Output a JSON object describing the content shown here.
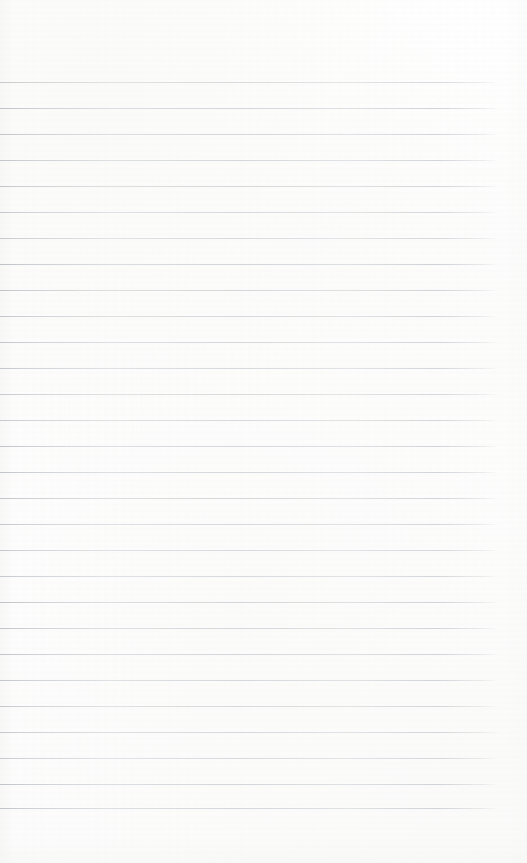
{
  "document": {
    "type": "scanned-lined-notebook-page",
    "title": "Blank lined notebook page",
    "orientation": "portrait",
    "width_px": 527,
    "height_px": 863,
    "background_color": "#fefefe",
    "content_text": "",
    "has_handwriting": false,
    "has_printed_text": false
  },
  "ruling": {
    "line_color": "#c2c7cd",
    "line_thickness_px": 1,
    "line_count": 29,
    "first_line_y_px": 82,
    "line_spacing_px": 26,
    "line_start_x_px": 0,
    "line_end_x_px": 497,
    "margin_top_px": 82,
    "margin_bottom_px": 55,
    "margin_right_px": 30,
    "margin_left_px": 0,
    "vertical_margin_rule": false,
    "line_y_positions": [
      82,
      108,
      134,
      160,
      186,
      212,
      238,
      264,
      290,
      316,
      342,
      368,
      394,
      420,
      446,
      472,
      498,
      524,
      550,
      576,
      602,
      628,
      654,
      680,
      706,
      732,
      758,
      784,
      808
    ]
  }
}
